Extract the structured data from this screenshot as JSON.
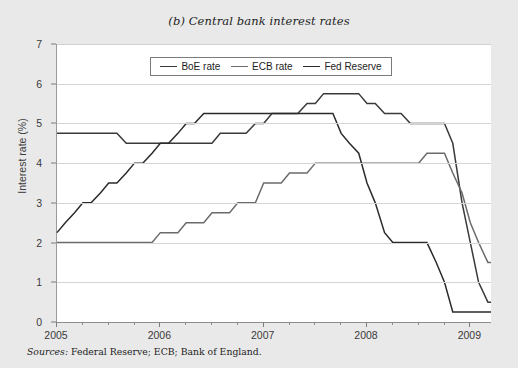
{
  "chart_data": {
    "type": "line",
    "title": "(b) Central bank interest rates",
    "xlabel": "",
    "ylabel": "Interest rate (%)",
    "xlim": [
      2005.0,
      2009.2
    ],
    "ylim": [
      0,
      7
    ],
    "ytick_labels": [
      "0",
      "1",
      "2",
      "3",
      "4",
      "5",
      "6",
      "7"
    ],
    "ytick_values": [
      0,
      1,
      2,
      3,
      4,
      5,
      6,
      7
    ],
    "xtick_labels": [
      "2005",
      "2006",
      "2007",
      "2008",
      "2009"
    ],
    "xtick_values": [
      2005,
      2006,
      2007,
      2008,
      2009
    ],
    "x_minor_per_year": 4,
    "grid": "horizontal",
    "legend_position": "top-center",
    "series": [
      {
        "name": "BoE rate",
        "color": "#3a3a3a",
        "points": [
          [
            2005.0,
            4.75
          ],
          [
            2005.58,
            4.75
          ],
          [
            2005.67,
            4.5
          ],
          [
            2006.5,
            4.5
          ],
          [
            2006.58,
            4.75
          ],
          [
            2006.83,
            4.75
          ],
          [
            2006.92,
            5.0
          ],
          [
            2007.0,
            5.0
          ],
          [
            2007.08,
            5.25
          ],
          [
            2007.33,
            5.25
          ],
          [
            2007.42,
            5.5
          ],
          [
            2007.5,
            5.5
          ],
          [
            2007.58,
            5.75
          ],
          [
            2007.92,
            5.75
          ],
          [
            2008.0,
            5.5
          ],
          [
            2008.08,
            5.5
          ],
          [
            2008.17,
            5.25
          ],
          [
            2008.33,
            5.25
          ],
          [
            2008.42,
            5.0
          ],
          [
            2008.75,
            5.0
          ],
          [
            2008.83,
            4.5
          ],
          [
            2008.92,
            3.0
          ],
          [
            2009.0,
            2.0
          ],
          [
            2009.08,
            1.0
          ],
          [
            2009.17,
            0.5
          ],
          [
            2009.2,
            0.5
          ]
        ]
      },
      {
        "name": "ECB rate",
        "color": "#6b6b6b",
        "points": [
          [
            2005.0,
            2.0
          ],
          [
            2005.92,
            2.0
          ],
          [
            2006.0,
            2.25
          ],
          [
            2006.17,
            2.25
          ],
          [
            2006.25,
            2.5
          ],
          [
            2006.42,
            2.5
          ],
          [
            2006.5,
            2.75
          ],
          [
            2006.67,
            2.75
          ],
          [
            2006.75,
            3.0
          ],
          [
            2006.92,
            3.0
          ],
          [
            2007.0,
            3.5
          ],
          [
            2007.17,
            3.5
          ],
          [
            2007.25,
            3.75
          ],
          [
            2007.42,
            3.75
          ],
          [
            2007.5,
            4.0
          ],
          [
            2008.5,
            4.0
          ],
          [
            2008.58,
            4.25
          ],
          [
            2008.75,
            4.25
          ],
          [
            2008.83,
            3.75
          ],
          [
            2008.92,
            3.25
          ],
          [
            2009.0,
            2.5
          ],
          [
            2009.08,
            2.0
          ],
          [
            2009.17,
            1.5
          ],
          [
            2009.2,
            1.5
          ]
        ]
      },
      {
        "name": "Fed Reserve",
        "color": "#2b2b2b",
        "points": [
          [
            2005.0,
            2.25
          ],
          [
            2005.08,
            2.5
          ],
          [
            2005.17,
            2.75
          ],
          [
            2005.25,
            3.0
          ],
          [
            2005.33,
            3.0
          ],
          [
            2005.42,
            3.25
          ],
          [
            2005.5,
            3.5
          ],
          [
            2005.58,
            3.5
          ],
          [
            2005.67,
            3.75
          ],
          [
            2005.75,
            4.0
          ],
          [
            2005.83,
            4.0
          ],
          [
            2005.92,
            4.25
          ],
          [
            2006.0,
            4.5
          ],
          [
            2006.08,
            4.5
          ],
          [
            2006.17,
            4.75
          ],
          [
            2006.25,
            5.0
          ],
          [
            2006.33,
            5.0
          ],
          [
            2006.42,
            5.25
          ],
          [
            2007.67,
            5.25
          ],
          [
            2007.75,
            4.75
          ],
          [
            2007.83,
            4.5
          ],
          [
            2007.92,
            4.25
          ],
          [
            2008.0,
            3.5
          ],
          [
            2008.08,
            3.0
          ],
          [
            2008.17,
            2.25
          ],
          [
            2008.25,
            2.0
          ],
          [
            2008.33,
            2.0
          ],
          [
            2008.42,
            2.0
          ],
          [
            2008.5,
            2.0
          ],
          [
            2008.58,
            2.0
          ],
          [
            2008.67,
            1.5
          ],
          [
            2008.75,
            1.0
          ],
          [
            2008.83,
            0.25
          ],
          [
            2009.2,
            0.25
          ]
        ]
      }
    ]
  },
  "source": {
    "label": "Sources:",
    "text": " Federal Reserve; ECB; Bank of England."
  }
}
